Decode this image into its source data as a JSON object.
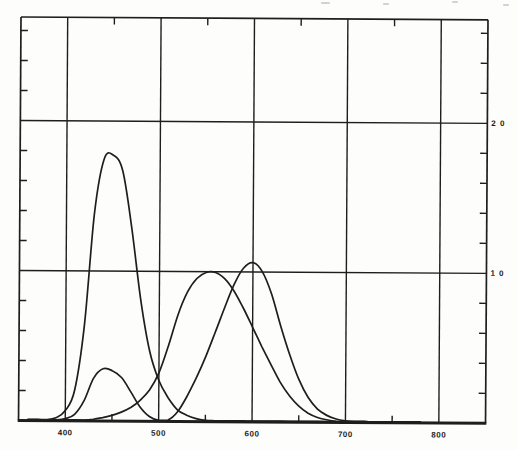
{
  "chart_data": {
    "type": "line",
    "title": "",
    "xlabel": "",
    "ylabel": "",
    "xlim": [
      350,
      850
    ],
    "ylim": [
      0,
      2.69
    ],
    "grid": true,
    "legend_position": "none",
    "line_color": "#1e1e1e",
    "background": "#fdfdfc",
    "x_major_ticks": [
      400,
      500,
      600,
      700,
      800
    ],
    "x_tick_labels": [
      "400",
      "500",
      "600",
      "700",
      "800"
    ],
    "x_minor_ticks": [
      450,
      550,
      650,
      750
    ],
    "y_gridlines": [
      1.0,
      2.0
    ],
    "y_tick_labels": [
      "1 0",
      "2 0"
    ],
    "y_minor_ticks": [
      0.2,
      0.4,
      0.6,
      0.8,
      1.2,
      1.4,
      1.6,
      1.8,
      2.2,
      2.4,
      2.6
    ],
    "x": [
      360,
      370,
      380,
      390,
      400,
      410,
      420,
      430,
      440,
      450,
      460,
      470,
      480,
      490,
      500,
      510,
      520,
      530,
      540,
      550,
      560,
      570,
      580,
      590,
      600,
      610,
      620,
      630,
      640,
      650,
      660,
      670,
      680,
      690,
      700,
      710,
      720,
      730,
      740,
      750,
      760,
      770,
      780
    ],
    "series": [
      {
        "name": "zbar",
        "values": [
          0.0006,
          0.0019,
          0.0065,
          0.0201,
          0.0679,
          0.2074,
          0.6456,
          1.3856,
          1.7471,
          1.7721,
          1.6692,
          1.2876,
          0.813,
          0.4652,
          0.272,
          0.1582,
          0.0782,
          0.0422,
          0.0203,
          0.0087,
          0.0039,
          0.0021,
          0.0017,
          0.0011,
          0.0008,
          0.0003,
          0.0002,
          0.0,
          0.0,
          0.0,
          0.0,
          0.0,
          0.0,
          0.0,
          0.0,
          0.0,
          0.0,
          0.0,
          0.0,
          0.0,
          0.0,
          0.0,
          0.0
        ]
      },
      {
        "name": "ybar",
        "values": [
          0.0,
          0.0,
          0.0,
          0.0001,
          0.0004,
          0.0012,
          0.004,
          0.0116,
          0.023,
          0.038,
          0.06,
          0.091,
          0.139,
          0.208,
          0.323,
          0.503,
          0.71,
          0.862,
          0.954,
          0.995,
          0.995,
          0.952,
          0.87,
          0.757,
          0.631,
          0.503,
          0.381,
          0.265,
          0.175,
          0.107,
          0.061,
          0.032,
          0.017,
          0.0082,
          0.0041,
          0.0021,
          0.001,
          0.0005,
          0.0002,
          0.0001,
          0.0001,
          0.0,
          0.0
        ]
      },
      {
        "name": "xbar",
        "values": [
          0.0001,
          0.0004,
          0.0014,
          0.0042,
          0.0143,
          0.0435,
          0.1344,
          0.2839,
          0.3483,
          0.3362,
          0.2908,
          0.1954,
          0.0956,
          0.032,
          0.0049,
          0.0093,
          0.0633,
          0.1655,
          0.2904,
          0.4334,
          0.5945,
          0.7621,
          0.9163,
          1.0263,
          1.0622,
          1.0026,
          0.8544,
          0.6424,
          0.4479,
          0.2835,
          0.1649,
          0.0874,
          0.0468,
          0.0227,
          0.0114,
          0.0058,
          0.0029,
          0.0014,
          0.0007,
          0.0003,
          0.0002,
          0.0001,
          0.0
        ]
      }
    ]
  }
}
